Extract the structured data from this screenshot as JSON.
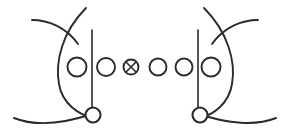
{
  "figure": {
    "width": 288,
    "height": 137,
    "background_color": "#ffffff",
    "ink_color": "#2b2b2f"
  },
  "style": {
    "curve_stroke_width": 1.9,
    "bead_stroke_width": 1.9,
    "spine_stroke_width": 1.6,
    "cross_stroke_width": 1.6,
    "terminal_stroke_width": 2.1
  },
  "left_group": {
    "name": "left-strand-group",
    "bracket_curve": {
      "name": "left-bracket-curve",
      "path": "M 86 8 C 62 32, 55 62, 59 84 C 62 103, 78 115, 94 118"
    },
    "upper_whisker": {
      "name": "left-upper-whisker",
      "path": "M 32 20 C 48 20, 66 27, 78 44"
    },
    "lower_whisker": {
      "name": "left-lower-whisker",
      "path": "M 14 118 C 34 126, 62 124, 92 114"
    },
    "spine": {
      "name": "left-spine-line",
      "x": 92,
      "y_top": 30,
      "y_bottom": 108
    },
    "terminal_node": {
      "name": "left-terminal-node",
      "cx": 93,
      "cy": 115,
      "r": 7.5
    }
  },
  "right_group": {
    "name": "right-strand-group",
    "bracket_curve": {
      "name": "right-bracket-curve",
      "path": "M 204 8 C 228 32, 236 62, 232 84 C 229 103, 214 115, 199 118"
    },
    "upper_whisker": {
      "name": "right-upper-whisker",
      "path": "M 258 20 C 242 20, 224 27, 212 44"
    },
    "lower_whisker": {
      "name": "right-lower-whisker",
      "path": "M 276 118 C 256 126, 228 124, 199 114"
    },
    "spine": {
      "name": "right-spine-line",
      "x": 198,
      "y_top": 30,
      "y_bottom": 108
    },
    "terminal_node": {
      "name": "right-terminal-node",
      "cx": 200,
      "cy": 115,
      "r": 7.5
    }
  },
  "bead_chain": {
    "name": "bead-chain",
    "count": 6,
    "center_y": 67,
    "beads": [
      {
        "index": 1,
        "cx": 77,
        "cy": 67,
        "r": 9.5,
        "marked": false,
        "symbol": ""
      },
      {
        "index": 2,
        "cx": 106,
        "cy": 67,
        "r": 9.0,
        "marked": false,
        "symbol": ""
      },
      {
        "index": 3,
        "cx": 131,
        "cy": 67,
        "r": 7.5,
        "marked": true,
        "symbol": "x-cross"
      },
      {
        "index": 4,
        "cx": 158,
        "cy": 67,
        "r": 8.5,
        "marked": false,
        "symbol": ""
      },
      {
        "index": 5,
        "cx": 184,
        "cy": 67,
        "r": 8.5,
        "marked": false,
        "symbol": ""
      },
      {
        "index": 6,
        "cx": 211,
        "cy": 67,
        "r": 9.5,
        "marked": false,
        "symbol": ""
      }
    ]
  },
  "marked_bead": {
    "name": "marked-bead-otimes",
    "label": "⊗",
    "cx": 131,
    "cy": 67,
    "r": 7.5,
    "cross_half": 5.0
  }
}
